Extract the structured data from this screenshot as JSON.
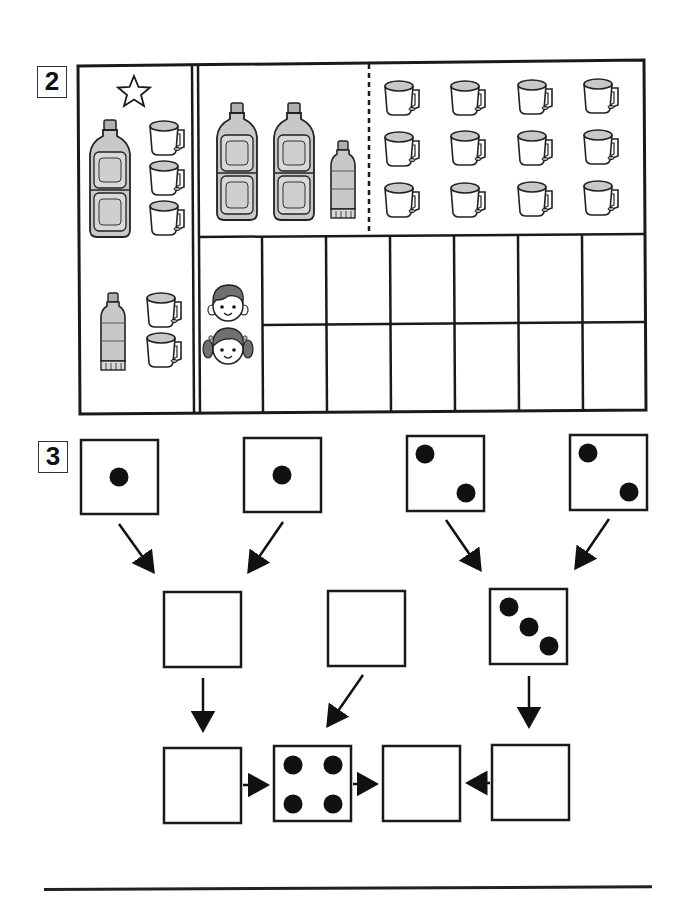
{
  "sections": [
    {
      "number": "2",
      "type": "counting-table",
      "reference_panel": {
        "star_symbol": "☆",
        "groups": [
          {
            "big_bottles": 1,
            "small_bottles": 0,
            "cups": 3
          },
          {
            "big_bottles": 0,
            "small_bottles": 1,
            "cups": 2
          }
        ]
      },
      "items_panel": {
        "big_bottles": 2,
        "small_bottles": 1,
        "cups": {
          "rows": 3,
          "cols": 4,
          "total": 12
        }
      },
      "answer_grid": {
        "row_labels": [
          "boy-face",
          "girl-face"
        ],
        "rows": 2,
        "cols": 6
      }
    },
    {
      "number": "3",
      "type": "dice-addition-tree",
      "top_row": [
        {
          "id": "a",
          "dots": 1
        },
        {
          "id": "b",
          "dots": 1
        },
        {
          "id": "c",
          "dots": 2
        },
        {
          "id": "d",
          "dots": 2
        }
      ],
      "middle_row": [
        {
          "id": "e",
          "dots": null
        },
        {
          "id": "f",
          "dots": null
        },
        {
          "id": "g",
          "dots": 3
        }
      ],
      "bottom_row": [
        {
          "id": "h",
          "dots": null
        },
        {
          "id": "i",
          "dots": 4
        },
        {
          "id": "j",
          "dots": null
        },
        {
          "id": "k",
          "dots": null
        }
      ],
      "arrows": [
        [
          "a",
          "e"
        ],
        [
          "b",
          "e"
        ],
        [
          "c",
          "g"
        ],
        [
          "d",
          "g"
        ],
        [
          "e",
          "h"
        ],
        [
          "f",
          "i"
        ],
        [
          "g",
          "k"
        ],
        [
          "h",
          "i"
        ],
        [
          "i",
          "j"
        ],
        [
          "k",
          "j"
        ]
      ]
    }
  ],
  "colors": {
    "ink": "#1a1a1a",
    "bottle_fill": "#c8c8c8",
    "bottle_panel": "#dcdcdc",
    "cup_top": "#c8c8c8",
    "hair": "#707070"
  }
}
